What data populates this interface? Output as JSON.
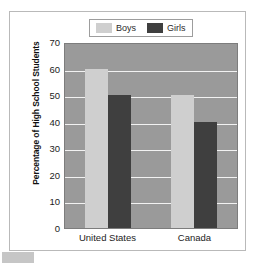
{
  "chart_data": {
    "type": "bar",
    "title": "",
    "subtitle": "",
    "xlabel": "",
    "ylabel": "Percentage of High School Students",
    "categories": [
      "United States",
      "Canada"
    ],
    "series": [
      {
        "name": "Boys",
        "values": [
          60,
          50
        ],
        "color": "#cfcfcf"
      },
      {
        "name": "Girls",
        "values": [
          50,
          40
        ],
        "color": "#3f3f3f"
      }
    ],
    "ylim": [
      0,
      70
    ],
    "yticks": [
      0,
      10,
      20,
      30,
      40,
      50,
      60,
      70
    ],
    "ytick_labels": [
      "0",
      "10",
      "20",
      "30",
      "40",
      "50",
      "60",
      "70"
    ],
    "grid": true,
    "gridline_color": "#f2f2f2",
    "plot_background": "#9a9a9a",
    "legend_position": "top-center"
  },
  "legend": {
    "entries": [
      {
        "label": "Boys",
        "swatch_color": "#cfcfcf"
      },
      {
        "label": "Girls",
        "swatch_color": "#3f3f3f"
      }
    ]
  },
  "figure": {
    "frame_border_color": "#b9b9b9",
    "background": "#ffffff",
    "corner_swatch_color": "#c6c6c6"
  }
}
